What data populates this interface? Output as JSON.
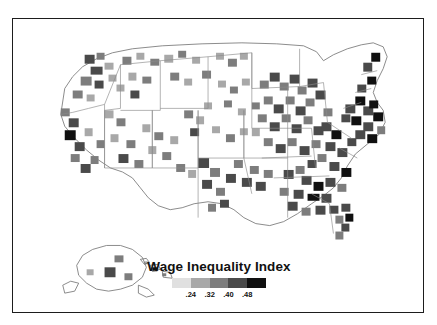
{
  "figure": {
    "type": "choropleth-map",
    "region": "United States",
    "unit": "county",
    "top_artifact_text": "· · · · ·"
  },
  "legend": {
    "title": "Wage Inequality Index",
    "swatches": [
      "#e0e0e0",
      "#a8a8a8",
      "#7d7d7d",
      "#4a4a4a",
      "#101010"
    ],
    "ticks": [
      "",
      ".24",
      ".32",
      ".40",
      ".48",
      ""
    ],
    "tick_labels": [
      ".24",
      ".32",
      ".40",
      ".48"
    ],
    "tick_positions_pct": [
      20,
      40,
      60,
      80
    ]
  },
  "colors": {
    "frame": "#1d1d1d",
    "background": "#ffffff",
    "land_fill": "#ffffff",
    "county_stroke": "#b9b9b9",
    "state_stroke": "#8a8a8a",
    "nation_stroke": "#6e6e6e"
  },
  "chart_data": {
    "type": "heatmap",
    "title": "Wage Inequality Index",
    "xlabel": "",
    "ylabel": "",
    "legend_position": "bottom-center",
    "grid": false,
    "bins": [
      {
        "label": "< .24",
        "color": "#e0e0e0"
      },
      {
        "label": ".24-.32",
        "color": "#a8a8a8"
      },
      {
        "label": ".32-.40",
        "color": "#7d7d7d"
      },
      {
        "label": ".40-.48",
        "color": "#4a4a4a"
      },
      {
        "label": "> .48",
        "color": "#101010"
      }
    ],
    "tick_values": [
      0.24,
      0.32,
      0.4,
      0.48
    ],
    "value_range": [
      0.16,
      0.56
    ],
    "regions": [
      {
        "name": "Pacific Northwest",
        "density": "low",
        "note": "scattered dark patches inland"
      },
      {
        "name": "California",
        "density": "high",
        "note": "Bay Area and coastal counties darkest"
      },
      {
        "name": "Mountain West",
        "density": "low",
        "note": "large unshaded basins"
      },
      {
        "name": "Great Plains",
        "density": "very-low",
        "note": "mostly unshaded"
      },
      {
        "name": "Texas",
        "density": "moderate",
        "note": "dark clusters along Gulf and border"
      },
      {
        "name": "Midwest",
        "density": "moderate",
        "note": "dense around Great Lakes"
      },
      {
        "name": "Appalachia",
        "density": "very-high",
        "note": "near-continuous dark band"
      },
      {
        "name": "Southeast",
        "density": "high",
        "note": "one solid black county in Georgia"
      },
      {
        "name": "Northeast",
        "density": "very-high",
        "note": "dense corridor into Maine"
      },
      {
        "name": "Florida",
        "density": "high",
        "note": "dark along both coasts"
      },
      {
        "name": "Alaska",
        "density": "low",
        "note": "few shaded boroughs, inset"
      },
      {
        "name": "Hawaii",
        "density": "low",
        "note": "small dark island, inset"
      }
    ]
  }
}
